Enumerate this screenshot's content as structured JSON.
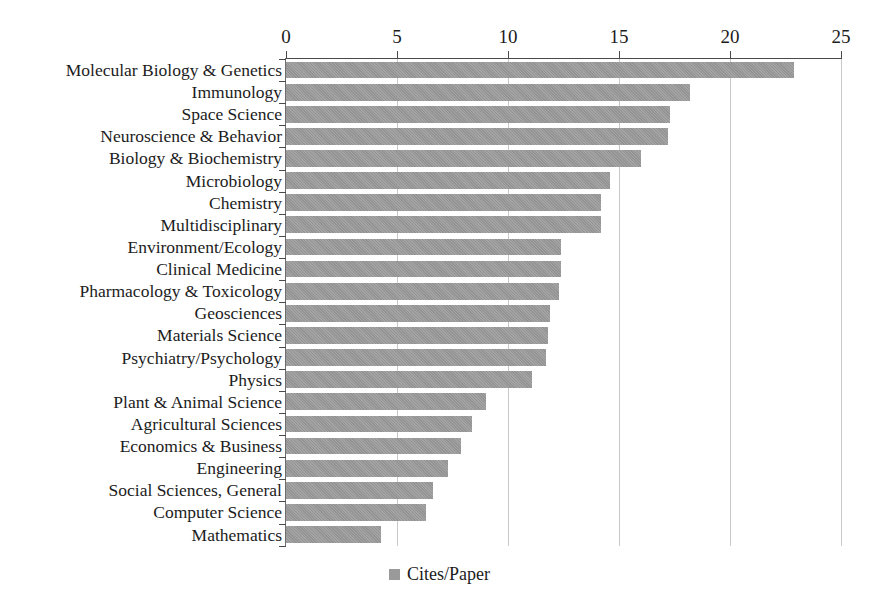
{
  "chart_data": {
    "type": "bar",
    "orientation": "horizontal",
    "title": "",
    "subtitle": "",
    "xlabel": "",
    "ylabel": "",
    "xlim": [
      0,
      25
    ],
    "xticks": [
      0,
      5,
      10,
      15,
      20,
      25
    ],
    "xtick_labels": [
      "0",
      "5",
      "10",
      "15",
      "20",
      "25"
    ],
    "grid": "vertical",
    "legend_position": "bottom-center",
    "series": [
      {
        "name": "Cites/Paper",
        "color": "#9a9a9a",
        "values": [
          22.9,
          18.2,
          17.3,
          17.2,
          16.0,
          14.6,
          14.2,
          14.2,
          12.4,
          12.4,
          12.3,
          11.9,
          11.8,
          11.7,
          11.1,
          9.0,
          8.4,
          7.9,
          7.3,
          6.6,
          6.3,
          4.3
        ]
      }
    ],
    "categories": [
      "Molecular Biology & Genetics",
      "Immunology",
      "Space Science",
      "Neuroscience & Behavior",
      "Biology & Biochemistry",
      "Microbiology",
      "Chemistry",
      "Multidisciplinary",
      "Environment/Ecology",
      "Clinical Medicine",
      "Pharmacology & Toxicology",
      "Geosciences",
      "Materials Science",
      "Psychiatry/Psychology",
      "Physics",
      "Plant & Animal Science",
      "Agricultural Sciences",
      "Economics & Business",
      "Engineering",
      "Social Sciences, General",
      "Computer Science",
      "Mathematics"
    ]
  },
  "legend": {
    "entries": [
      {
        "label": "Cites/Paper",
        "swatch": "legend-swatch-icon",
        "color": "#9a9a9a"
      }
    ]
  },
  "colors": {
    "bar_fill": "#9a9a9a",
    "axis": "#4a4a4a",
    "gridline": "#c9c9c9",
    "text": "#1c1c1c",
    "background": "#ffffff"
  }
}
